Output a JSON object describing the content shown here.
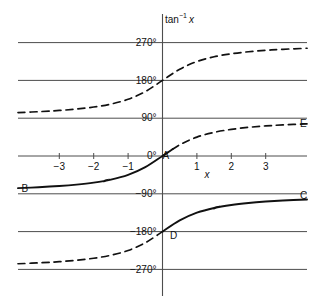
{
  "figure": {
    "name": "inverse-tangent-multivalued-graph",
    "background_color": "#ffffff",
    "ink_color": "#111111",
    "grid_color": "#4d4d4d"
  },
  "axes": {
    "y_axis_title_main": "tan",
    "y_axis_title_exponent": "−1",
    "y_axis_title_variable": "x",
    "x_axis_title": "x",
    "x_ticks": [
      {
        "label": "−3",
        "value": -3
      },
      {
        "label": "−2",
        "value": -2
      },
      {
        "label": "−1",
        "value": -1
      },
      {
        "label": "1",
        "value": 1
      },
      {
        "label": "2",
        "value": 2
      },
      {
        "label": "3",
        "value": 3
      }
    ],
    "y_ticks": [
      {
        "label": "270°",
        "value": 270
      },
      {
        "label": "180°",
        "value": 180
      },
      {
        "label": "90°",
        "value": 90
      },
      {
        "label": "0°",
        "value": 0
      },
      {
        "label": "−90°",
        "value": -90
      },
      {
        "label": "−180°",
        "value": -180
      },
      {
        "label": "−270°",
        "value": -270
      }
    ],
    "xlim": [
      -4.2,
      4.2
    ],
    "ylim": [
      -300,
      300
    ],
    "grid": "horizontal"
  },
  "point_labels": [
    {
      "id": "A",
      "text": "A",
      "x": 0,
      "y": 0
    },
    {
      "id": "B",
      "text": "B",
      "x": -4.1,
      "y": -80
    },
    {
      "id": "C",
      "text": "C",
      "x": 4.0,
      "y": -97
    },
    {
      "id": "D",
      "text": "D",
      "x": 0.22,
      "y": -192
    },
    {
      "id": "E",
      "text": "E",
      "x": 4.0,
      "y": 76
    }
  ],
  "chart_data": {
    "type": "line",
    "title": "",
    "xlabel": "x",
    "ylabel": "tan⁻¹ x",
    "xlim": [
      -4.2,
      4.2
    ],
    "ylim": [
      -300,
      300
    ],
    "grid": true,
    "grid_lines_y": [
      270,
      180,
      90,
      0,
      -90,
      -180,
      -270
    ],
    "legend": "none",
    "series": [
      {
        "name": "principal-branch",
        "style": "solid",
        "offset_degrees": 0,
        "endpoints": [
          "B",
          "A"
        ],
        "asymptotes": [
          -90,
          90
        ],
        "x": [
          -4.2,
          -3.6,
          -3.0,
          -2.5,
          -2.0,
          -1.5,
          -1.0,
          -0.5,
          0.0,
          0.3
        ],
        "values": [
          -76.6,
          -74.5,
          -71.6,
          -68.2,
          -63.4,
          -56.3,
          -45.0,
          -26.6,
          0.0,
          16.7
        ]
      },
      {
        "name": "upper-dashed-branch",
        "style": "dashed",
        "offset_degrees": 180,
        "endpoints": [
          "none",
          "none"
        ],
        "asymptotes": [
          90,
          270
        ],
        "x": [
          -4.2,
          -3.5,
          -3.0,
          -2.5,
          -2.0,
          -1.5,
          -1.0,
          -0.5,
          0.0,
          0.5,
          1.0,
          1.5,
          2.0,
          2.5,
          3.0,
          3.5,
          4.2
        ],
        "values": [
          103.4,
          105.9,
          108.4,
          111.8,
          116.6,
          123.7,
          135.0,
          153.4,
          180.0,
          206.6,
          225.0,
          236.3,
          243.4,
          248.2,
          251.6,
          254.1,
          256.6
        ]
      },
      {
        "name": "upper-right-dashed-tail",
        "style": "dashed",
        "offset_degrees": 0,
        "endpoints": [
          "A",
          "E"
        ],
        "asymptotes": [
          90
        ],
        "x": [
          0.0,
          0.5,
          1.0,
          1.5,
          2.0,
          2.5,
          3.0,
          3.5,
          4.2
        ],
        "values": [
          0.0,
          26.6,
          45.0,
          56.3,
          63.4,
          68.2,
          71.6,
          74.1,
          76.6
        ]
      },
      {
        "name": "lower-dashed-branch",
        "style": "dashed",
        "offset_degrees": -180,
        "endpoints": [
          "none",
          "D"
        ],
        "asymptotes": [
          -270,
          -90
        ],
        "x": [
          -4.2,
          -3.5,
          -3.0,
          -2.5,
          -2.0,
          -1.5,
          -1.0,
          -0.5,
          0.0
        ],
        "values": [
          -256.6,
          -254.1,
          -251.6,
          -248.2,
          -243.4,
          -236.3,
          -225.0,
          -206.6,
          -180.0
        ]
      },
      {
        "name": "lower-right-solid-branch",
        "style": "solid",
        "offset_degrees": -180,
        "endpoints": [
          "D",
          "C"
        ],
        "asymptotes": [
          -90
        ],
        "x": [
          0.0,
          0.5,
          1.0,
          1.5,
          2.0,
          2.5,
          3.0,
          3.5,
          4.2
        ],
        "values": [
          -180.0,
          -153.4,
          -135.0,
          -123.7,
          -116.6,
          -111.8,
          -108.4,
          -105.9,
          -103.4
        ]
      }
    ],
    "direction_arrows": [
      {
        "on_series": "principal-branch",
        "x": -1.6
      },
      {
        "on_series": "lower-right-solid-branch",
        "x": 1.6
      }
    ]
  }
}
